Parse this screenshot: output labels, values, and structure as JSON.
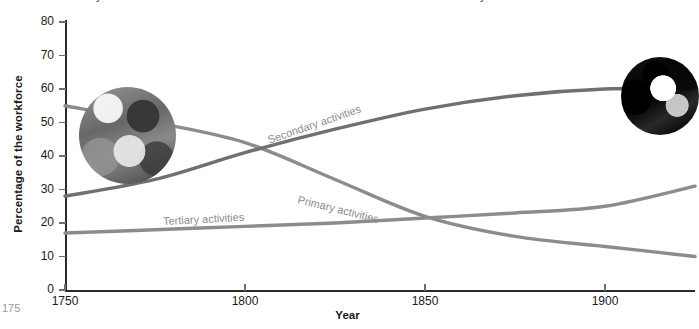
{
  "chart_data": {
    "type": "line",
    "title": "",
    "xlabel": "Year",
    "ylabel": "Percentage of the workforce",
    "xlim": [
      1750,
      1925
    ],
    "ylim": [
      0,
      80
    ],
    "grid": false,
    "legend_position": "inline-labels",
    "x_ticks": [
      "1750",
      "1800",
      "1850",
      "1900"
    ],
    "x_tick_values": [
      1750,
      1800,
      1850,
      1900
    ],
    "y_ticks": [
      "0",
      "10",
      "20",
      "30",
      "40",
      "50",
      "60",
      "70",
      "80"
    ],
    "y_tick_values": [
      0,
      10,
      20,
      30,
      40,
      50,
      60,
      70,
      80
    ],
    "x": [
      1750,
      1775,
      1800,
      1825,
      1850,
      1875,
      1900,
      1925
    ],
    "series": [
      {
        "name": "Primary activities",
        "label": "Primary activities",
        "color": "#8c8c8c",
        "values": [
          55,
          50,
          44,
          33,
          22,
          16,
          13,
          10
        ]
      },
      {
        "name": "Secondary activities",
        "label": "Secondary activities",
        "color": "#707070",
        "values": [
          28,
          33,
          41,
          48,
          54,
          58,
          60,
          60
        ]
      },
      {
        "name": "Tertiary activities",
        "label": "Tertiary activities",
        "color": "#8c8c8c",
        "values": [
          17,
          18,
          19,
          20,
          21.5,
          23,
          25,
          31
        ]
      }
    ],
    "annotations": [
      {
        "name": "primary-label",
        "text": "Primary activities"
      },
      {
        "name": "secondary-label",
        "text": "Secondary activities"
      },
      {
        "name": "tertiary-label",
        "text": "Tertiary activities"
      }
    ],
    "insets": [
      {
        "name": "agriculture-photo",
        "description": "farming scene",
        "at_year": 1772,
        "at_value": 47
      },
      {
        "name": "factory-worker-photo",
        "description": "factory worker",
        "at_value": 60,
        "at_year": 1917
      }
    ]
  },
  "axes": {
    "y_title": "Percentage of the workforce",
    "x_title": "Year"
  },
  "clipped": {
    "top_left": "y",
    "top_right": "y",
    "bottom_left": "175"
  }
}
